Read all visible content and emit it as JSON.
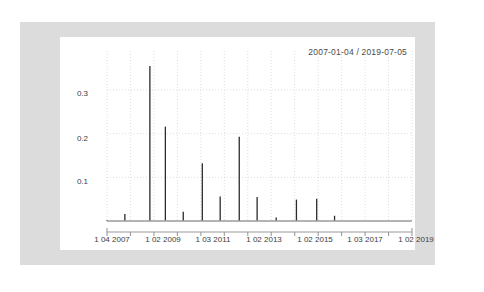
{
  "figure": {
    "title": "2007-01-04 / 2019-07-05",
    "frame_color": "#dcdcdc",
    "panel_color": "#ffffff",
    "series_color": "#2b2b2b",
    "grid_color": "#d0d0d0",
    "axis_color": "#808080"
  },
  "chart_data": {
    "type": "bar",
    "title": "2007-01-04 / 2019-07-05",
    "xlabel": "",
    "ylabel": "",
    "ylim": [
      0,
      0.38
    ],
    "yticks": [
      0.1,
      0.2,
      0.3
    ],
    "ytick_labels": [
      "0.1",
      "0.2",
      "0.3"
    ],
    "xtick_labels": [
      "1 04 2007",
      "1 02 2009",
      "1 03 2011",
      "1 02 2013",
      "1 02 2015",
      "1 03 2017",
      "1 02 2019"
    ],
    "grid": true,
    "legend": null,
    "categories": [
      "2007-01-04",
      "2007-10-01",
      "2008-07-01",
      "2009-02-01",
      "2009-10-01",
      "2010-07-01",
      "2011-03-01",
      "2011-12-01",
      "2012-08-01",
      "2013-02-01",
      "2014-01-01",
      "2015-02-01",
      "2015-11-01",
      "2017-03-01",
      "2018-01-01",
      "2019-02-01",
      "2019-07-05"
    ],
    "x_positions": [
      0.0,
      7.5,
      18.0,
      24.5,
      32.0,
      40.0,
      47.5,
      55.5,
      63.0,
      71.0,
      79.5,
      88.0,
      95.5,
      103.0,
      110.5,
      118.0,
      124.0
    ],
    "values": [
      0.002,
      0.016,
      0.355,
      0.216,
      0.021,
      0.132,
      0.056,
      0.193,
      0.055,
      0.008,
      0.049,
      0.051,
      0.012,
      0.0,
      0.0,
      0.0,
      0.0
    ]
  },
  "axis": {
    "y_tick_0": "0.1",
    "y_tick_1": "0.2",
    "y_tick_2": "0.3",
    "x_tick_0": "1 04 2007",
    "x_tick_1": "1 02 2009",
    "x_tick_2": "1 03 2011",
    "x_tick_3": "1 02 2013",
    "x_tick_4": "1 02 2015",
    "x_tick_5": "1 03 2017",
    "x_tick_6": "1 02 2019"
  }
}
